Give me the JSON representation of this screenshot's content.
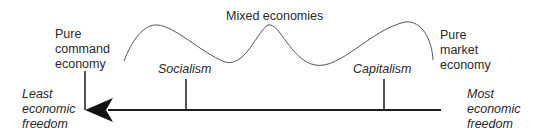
{
  "diagram": {
    "title": "Mixed economies",
    "left_end": {
      "system_label": "Pure\ncommand\neconomy",
      "freedom_label": "Least\neconomic\nfreedom"
    },
    "right_end": {
      "system_label": "Pure\nmarket\neconomy",
      "freedom_label": "Most\neconomic\nfreedom"
    },
    "ticks": [
      {
        "label": "Socialism"
      },
      {
        "label": "Capitalism"
      }
    ],
    "arrow": {
      "direction": "left",
      "meaning": "decreasing economic freedom"
    },
    "colors": {
      "line": "#1a1a1a",
      "curve": "#555555",
      "text": "#2a2a2a"
    }
  }
}
